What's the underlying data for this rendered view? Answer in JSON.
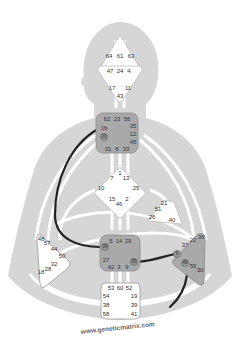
{
  "watermark": "www.geneticmatrix.com",
  "colors": {
    "silhouette": "#d6d6d6",
    "channel_open": "#ffffff",
    "center_undefined": "#ffffff",
    "center_defined": "#a9a9a9",
    "center_border": "#8a8a8a",
    "active_channel": "#222222",
    "text": "#333333"
  },
  "centers": {
    "head": {
      "gates": [
        "64",
        "61",
        "63"
      ],
      "defined": false
    },
    "ajna": {
      "gates": [
        "47",
        "24",
        "4",
        "17",
        "11",
        "43"
      ],
      "defined": false
    },
    "throat": {
      "gates": [
        "62",
        "23",
        "56",
        "16",
        "35",
        "12",
        "20",
        "45",
        "31",
        "8",
        "33"
      ],
      "defined": true
    },
    "g": {
      "gates": [
        "1",
        "7",
        "13",
        "10",
        "25",
        "15",
        "2",
        "46"
      ],
      "defined": false
    },
    "heart": {
      "gates": [
        "21",
        "51",
        "26",
        "40"
      ],
      "defined": false
    },
    "spleen": {
      "gates": [
        "48",
        "57",
        "44",
        "50",
        "32",
        "28",
        "18"
      ],
      "defined": false
    },
    "sacral": {
      "gates": [
        "5",
        "14",
        "29",
        "34",
        "27",
        "59",
        "42",
        "3",
        "9"
      ],
      "defined": true
    },
    "solar_plexus": {
      "gates": [
        "36",
        "22",
        "37",
        "6",
        "49",
        "55",
        "30"
      ],
      "defined": true
    },
    "root": {
      "gates": [
        "53",
        "60",
        "52",
        "54",
        "19",
        "38",
        "39",
        "58",
        "41"
      ],
      "defined": false
    }
  },
  "active_gates": [
    "20",
    "34",
    "59",
    "6",
    "49"
  ],
  "active_channels": [
    {
      "name": "20-34",
      "from": "throat",
      "to": "sacral"
    },
    {
      "name": "59-6",
      "from": "sacral",
      "to": "solar_plexus"
    },
    {
      "name": "49-19",
      "from": "solar_plexus",
      "to": "root",
      "partial": true
    }
  ]
}
